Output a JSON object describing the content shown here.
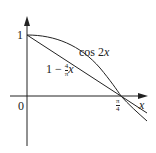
{
  "diagram": {
    "title": "",
    "axes": {
      "x_label": "x",
      "y_tick_label": "1",
      "origin_label": "0",
      "x_tick_label": {
        "numerator": "π",
        "denominator": "4"
      }
    },
    "curves": [
      {
        "name": "cos-2x",
        "label_text": "cos 2",
        "label_var": "x"
      },
      {
        "name": "linear-1-minus-4-over-pi-x",
        "label_prefix": "1 − ",
        "frac_num": "4",
        "frac_den": "π",
        "label_var": "x"
      }
    ],
    "colors": {
      "stroke": "#222222",
      "background": "#ffffff"
    }
  }
}
